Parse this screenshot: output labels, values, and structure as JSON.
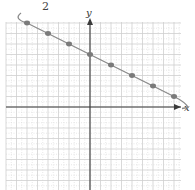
{
  "figure": {
    "top_label": "2",
    "x_axis_label": "x",
    "y_axis_label": "y"
  },
  "chart_data": {
    "type": "line",
    "title": "",
    "xlabel": "x",
    "ylabel": "y",
    "grid": true,
    "legend": null,
    "annotations": [
      "2"
    ],
    "x": [
      -6,
      -4,
      -2,
      0,
      2,
      4,
      6,
      8
    ],
    "series": [
      {
        "name": "curve",
        "values": [
          8,
          7,
          6,
          5,
          4,
          3,
          2,
          1
        ],
        "markers": true
      }
    ],
    "xlim": [
      -8,
      9
    ],
    "ylim": [
      -8,
      8
    ]
  },
  "geometry": {
    "origin_px": [
      90,
      107
    ],
    "unit_px": 10.5,
    "grid_left": 6,
    "grid_right": 181,
    "grid_top": 22,
    "grid_bottom": 190
  }
}
